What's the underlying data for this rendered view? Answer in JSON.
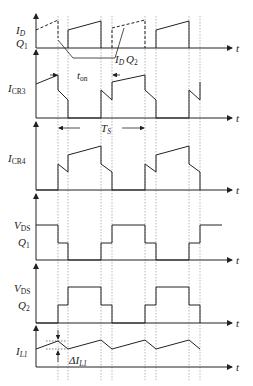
{
  "diagram": {
    "type": "timing-diagram",
    "axis_label": "t",
    "panels": [
      {
        "id": "id",
        "label_main": "I",
        "label_sub": "D",
        "label_line2": "Q",
        "label_line2_sub": "1",
        "annotation": "I_D Q_2"
      },
      {
        "id": "icr3",
        "label_main": "I",
        "label_sub": "CR3",
        "annotation": "t_on"
      },
      {
        "id": "icr4",
        "label_main": "I",
        "label_sub": "CR4",
        "annotation": "T_S"
      },
      {
        "id": "vds1",
        "label_main": "V",
        "label_sub": "DS",
        "label_line2": "Q",
        "label_line2_sub": "1"
      },
      {
        "id": "vds2",
        "label_main": "V",
        "label_sub": "DS",
        "label_line2": "Q",
        "label_line2_sub": "2"
      },
      {
        "id": "il1",
        "label_main": "I",
        "label_sub": "L1",
        "annotation": "ΔI_L1"
      }
    ],
    "annotations": {
      "id_q2": {
        "main": "I",
        "sub": "D",
        "second": "Q",
        "second_sub": "2"
      },
      "ton": {
        "main": "t",
        "sub": "on"
      },
      "ts": {
        "main": "T",
        "sub": "S"
      },
      "dil1": {
        "main": "ΔI",
        "sub": "L1"
      }
    }
  }
}
